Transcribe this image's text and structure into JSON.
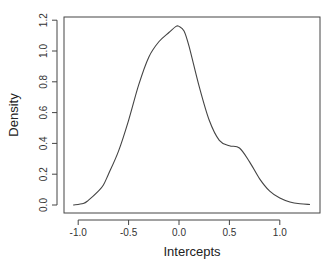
{
  "chart_data": {
    "type": "line",
    "title": "",
    "xlabel": "Intercepts",
    "ylabel": "Density",
    "xlim": [
      -1.15,
      1.4
    ],
    "ylim": [
      0,
      1.22
    ],
    "grid": false,
    "legend": null,
    "x_ticks": [
      -1.0,
      -0.5,
      0.0,
      0.5,
      1.0
    ],
    "x_tick_labels": [
      "-1.0",
      "-0.5",
      "0.0",
      "0.5",
      "1.0"
    ],
    "y_ticks": [
      0.0,
      0.2,
      0.4,
      0.6,
      0.8,
      1.0,
      1.2
    ],
    "y_tick_labels": [
      "0.0",
      "0.2",
      "0.4",
      "0.6",
      "0.8",
      "1.0",
      "1.2"
    ],
    "series": [
      {
        "name": "density",
        "color": "#444444",
        "x": [
          -1.05,
          -0.95,
          -0.9,
          -0.8,
          -0.75,
          -0.7,
          -0.6,
          -0.5,
          -0.4,
          -0.3,
          -0.2,
          -0.1,
          -0.03,
          0.0,
          0.05,
          0.1,
          0.2,
          0.3,
          0.4,
          0.5,
          0.6,
          0.7,
          0.8,
          0.9,
          1.0,
          1.1,
          1.2,
          1.3
        ],
        "y": [
          0.0,
          0.01,
          0.03,
          0.09,
          0.13,
          0.2,
          0.35,
          0.55,
          0.78,
          0.96,
          1.06,
          1.12,
          1.16,
          1.16,
          1.13,
          1.03,
          0.77,
          0.55,
          0.42,
          0.385,
          0.37,
          0.28,
          0.17,
          0.09,
          0.045,
          0.02,
          0.008,
          0.003
        ]
      }
    ]
  }
}
